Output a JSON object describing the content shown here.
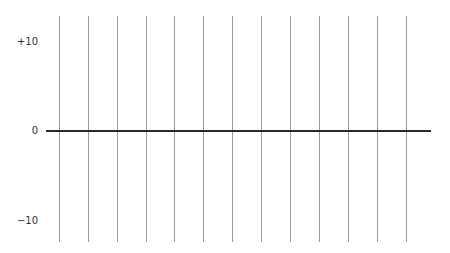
{
  "diagram": {
    "type": "number-line-grid",
    "y_labels": [
      {
        "text": "+10",
        "y": 42
      },
      {
        "text": "0",
        "y": 131
      },
      {
        "text": "−10",
        "y": 221
      }
    ],
    "vertical_lines_x": [
      59,
      88,
      117,
      146,
      174,
      203,
      232,
      261,
      290,
      319,
      348,
      377,
      406
    ],
    "vertical_lines_top": 16,
    "vertical_lines_bottom": 242,
    "zero_axis": {
      "y": 131,
      "x_start": 46,
      "x_end": 431
    },
    "colors": {
      "grid_line": "#9a9a9a",
      "axis_line": "#2b2b2b",
      "label": "#333333",
      "background": "#ffffff"
    }
  }
}
